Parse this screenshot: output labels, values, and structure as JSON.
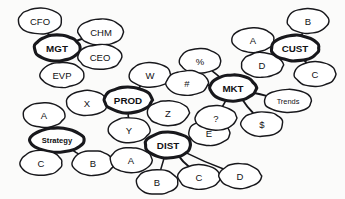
{
  "diagram": {
    "background_color": "#fbfbfa",
    "node_fill": "#ffffff",
    "stroke_color": "#18181c",
    "style": "hand-drawn ellipses",
    "nodes": [
      {
        "id": "CFO",
        "label": "CFO",
        "kind": "satellite",
        "cx": 40,
        "cy": 21,
        "rx": 22,
        "ry": 13
      },
      {
        "id": "CHM",
        "label": "CHM",
        "kind": "satellite",
        "cx": 101,
        "cy": 32,
        "rx": 23,
        "ry": 13
      },
      {
        "id": "MGT",
        "label": "MGT",
        "kind": "hub",
        "cx": 57,
        "cy": 48,
        "rx": 23,
        "ry": 13
      },
      {
        "id": "CEO",
        "label": "CEO",
        "kind": "satellite",
        "cx": 100,
        "cy": 57,
        "rx": 22,
        "ry": 12.5
      },
      {
        "id": "EVP",
        "label": "EVP",
        "kind": "satellite",
        "cx": 62,
        "cy": 75,
        "rx": 22,
        "ry": 12.5
      },
      {
        "id": "W",
        "label": "W",
        "kind": "satellite",
        "cx": 150,
        "cy": 75,
        "rx": 21,
        "ry": 12.5
      },
      {
        "id": "X",
        "label": "X",
        "kind": "satellite",
        "cx": 87,
        "cy": 103,
        "rx": 21,
        "ry": 12.5
      },
      {
        "id": "PROD",
        "label": "PROD",
        "kind": "hub",
        "cx": 128,
        "cy": 100,
        "rx": 24,
        "ry": 13
      },
      {
        "id": "Y",
        "label": "Y",
        "kind": "satellite",
        "cx": 129,
        "cy": 130,
        "rx": 21,
        "ry": 12.5
      },
      {
        "id": "Z",
        "label": "Z",
        "kind": "satellite",
        "cx": 168,
        "cy": 113,
        "rx": 21,
        "ry": 12.5
      },
      {
        "id": "A_left",
        "label": "A",
        "kind": "satellite",
        "cx": 44,
        "cy": 115,
        "rx": 21,
        "ry": 12.5
      },
      {
        "id": "Strategy",
        "label": "Strategy",
        "kind": "hub",
        "cx": 57,
        "cy": 140,
        "rx": 27,
        "ry": 12
      },
      {
        "id": "C_left",
        "label": "C",
        "kind": "satellite",
        "cx": 41,
        "cy": 163,
        "rx": 21,
        "ry": 12.5
      },
      {
        "id": "B_left",
        "label": "B",
        "kind": "satellite",
        "cx": 93,
        "cy": 163,
        "rx": 21,
        "ry": 12.5
      },
      {
        "id": "A_dist",
        "label": "A",
        "kind": "satellite",
        "cx": 131,
        "cy": 160,
        "rx": 21,
        "ry": 12.5
      },
      {
        "id": "DIST",
        "label": "DIST",
        "kind": "hub",
        "cx": 168,
        "cy": 145,
        "rx": 23,
        "ry": 13
      },
      {
        "id": "B_dist",
        "label": "B",
        "kind": "satellite",
        "cx": 157,
        "cy": 182,
        "rx": 21,
        "ry": 12.5
      },
      {
        "id": "C_dist",
        "label": "C",
        "kind": "satellite",
        "cx": 199,
        "cy": 177,
        "rx": 21,
        "ry": 12.5
      },
      {
        "id": "D_dist",
        "label": "D",
        "kind": "satellite",
        "cx": 240,
        "cy": 176,
        "rx": 21,
        "ry": 12.5
      },
      {
        "id": "E",
        "label": "E",
        "kind": "satellite",
        "cx": 209,
        "cy": 133,
        "rx": 21,
        "ry": 12.5
      },
      {
        "id": "Q",
        "label": "?",
        "kind": "satellite",
        "cx": 216,
        "cy": 118,
        "rx": 21,
        "ry": 12.5
      },
      {
        "id": "PCT",
        "label": "%",
        "kind": "satellite",
        "cx": 200,
        "cy": 61,
        "rx": 21,
        "ry": 12.5
      },
      {
        "id": "HASH",
        "label": "#",
        "kind": "satellite",
        "cx": 187,
        "cy": 83,
        "rx": 21,
        "ry": 12.5
      },
      {
        "id": "MKT",
        "label": "MKT",
        "kind": "hub",
        "cx": 233,
        "cy": 88,
        "rx": 23,
        "ry": 13
      },
      {
        "id": "DOLLAR",
        "label": "$",
        "kind": "satellite",
        "cx": 262,
        "cy": 124,
        "rx": 21,
        "ry": 12.5
      },
      {
        "id": "Trends",
        "label": "Trends",
        "kind": "satellite",
        "cx": 288,
        "cy": 101,
        "rx": 24,
        "ry": 11.5
      },
      {
        "id": "A_cust",
        "label": "A",
        "kind": "satellite",
        "cx": 253,
        "cy": 40,
        "rx": 21,
        "ry": 12.5
      },
      {
        "id": "D_cust",
        "label": "D",
        "kind": "satellite",
        "cx": 262,
        "cy": 65,
        "rx": 21,
        "ry": 12.5
      },
      {
        "id": "CUST",
        "label": "CUST",
        "kind": "hub",
        "cx": 295,
        "cy": 48,
        "rx": 24,
        "ry": 13
      },
      {
        "id": "B_cust",
        "label": "B",
        "kind": "satellite",
        "cx": 308,
        "cy": 21,
        "rx": 21,
        "ry": 12.5
      },
      {
        "id": "C_cust",
        "label": "C",
        "kind": "satellite",
        "cx": 315,
        "cy": 74,
        "rx": 21,
        "ry": 12.5
      }
    ],
    "edges": [
      {
        "from": "CFO",
        "to": "MGT"
      },
      {
        "from": "CHM",
        "to": "MGT"
      },
      {
        "from": "CEO",
        "to": "MGT"
      },
      {
        "from": "EVP",
        "to": "MGT"
      },
      {
        "from": "W",
        "to": "PROD"
      },
      {
        "from": "X",
        "to": "PROD"
      },
      {
        "from": "Y",
        "to": "PROD"
      },
      {
        "from": "Z",
        "to": "PROD"
      },
      {
        "from": "A_left",
        "to": "Strategy"
      },
      {
        "from": "C_left",
        "to": "Strategy"
      },
      {
        "from": "B_left",
        "to": "Strategy"
      },
      {
        "from": "A_dist",
        "to": "DIST"
      },
      {
        "from": "B_dist",
        "to": "DIST"
      },
      {
        "from": "C_dist",
        "to": "DIST"
      },
      {
        "from": "D_dist",
        "to": "DIST"
      },
      {
        "from": "E",
        "to": "DIST"
      },
      {
        "from": "PCT",
        "to": "MKT"
      },
      {
        "from": "HASH",
        "to": "MKT"
      },
      {
        "from": "Q",
        "to": "MKT"
      },
      {
        "from": "DOLLAR",
        "to": "MKT"
      },
      {
        "from": "Trends",
        "to": "MKT"
      },
      {
        "from": "A_cust",
        "to": "CUST"
      },
      {
        "from": "B_cust",
        "to": "CUST"
      },
      {
        "from": "C_cust",
        "to": "CUST"
      },
      {
        "from": "D_cust",
        "to": "CUST"
      }
    ]
  }
}
